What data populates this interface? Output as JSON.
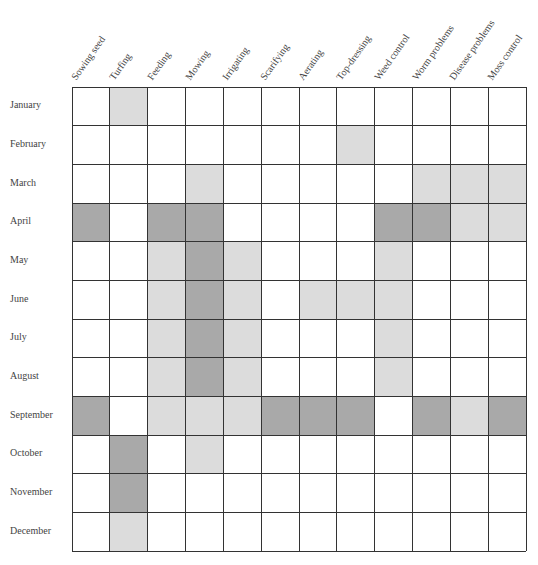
{
  "chart_data": {
    "type": "heatmap",
    "title": "",
    "columns": [
      "Sowing seed",
      "Turfing",
      "Feeding",
      "Mowing",
      "Irrigating",
      "Scarifying",
      "Aerating",
      "Top-dressing",
      "Weed control",
      "Worm problems",
      "Disease problems",
      "Moss control"
    ],
    "rows": [
      "January",
      "February",
      "March",
      "April",
      "May",
      "June",
      "July",
      "August",
      "September",
      "October",
      "November",
      "December"
    ],
    "legend": "Shading intensity: 0 = none, 1 = light, 2 = dark",
    "values": [
      [
        0,
        1,
        0,
        0,
        0,
        0,
        0,
        0,
        0,
        0,
        0,
        0
      ],
      [
        0,
        0,
        0,
        0,
        0,
        0,
        0,
        1,
        0,
        0,
        0,
        0
      ],
      [
        0,
        0,
        0,
        1,
        0,
        0,
        0,
        0,
        0,
        1,
        1,
        1
      ],
      [
        2,
        0,
        2,
        2,
        0,
        0,
        0,
        0,
        2,
        2,
        1,
        1
      ],
      [
        0,
        0,
        1,
        2,
        1,
        0,
        0,
        0,
        1,
        0,
        0,
        0
      ],
      [
        0,
        0,
        1,
        2,
        1,
        0,
        1,
        1,
        1,
        0,
        0,
        0
      ],
      [
        0,
        0,
        1,
        2,
        1,
        0,
        0,
        0,
        1,
        0,
        0,
        0
      ],
      [
        0,
        0,
        1,
        2,
        1,
        0,
        0,
        0,
        1,
        0,
        0,
        0
      ],
      [
        2,
        0,
        1,
        1,
        1,
        2,
        2,
        2,
        0,
        2,
        1,
        2
      ],
      [
        0,
        2,
        0,
        1,
        0,
        0,
        0,
        0,
        0,
        0,
        0,
        0
      ],
      [
        0,
        2,
        0,
        0,
        0,
        0,
        0,
        0,
        0,
        0,
        0,
        0
      ],
      [
        0,
        1,
        0,
        0,
        0,
        0,
        0,
        0,
        0,
        0,
        0,
        0
      ]
    ],
    "colors": {
      "light": "#dcdcdc",
      "dark": "#a9a9a9",
      "grid": "#333333"
    },
    "grid": true
  }
}
